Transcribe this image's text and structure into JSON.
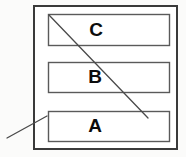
{
  "diagram": {
    "type": "schematic",
    "canvas": {
      "width": 186,
      "height": 157,
      "background": "#fbfbfa"
    },
    "outer_frame": {
      "name": "outer-container",
      "x": 33,
      "y": 5,
      "width": 145,
      "height": 145,
      "stroke": "#3a3a3a",
      "stroke_width": 2,
      "fill": "#ffffff"
    },
    "layers": [
      {
        "id": "layer-c",
        "label": "C",
        "x": 48,
        "y": 14,
        "width": 122,
        "height": 32,
        "stroke": "#5a5a5a",
        "stroke_width": 1.4,
        "fill": "#ffffff"
      },
      {
        "id": "layer-b",
        "label": "B",
        "x": 48,
        "y": 62,
        "width": 122,
        "height": 31,
        "stroke": "#5a5a5a",
        "stroke_width": 1.4,
        "fill": "#ffffff"
      },
      {
        "id": "layer-a",
        "label": "A",
        "x": 48,
        "y": 111,
        "width": 122,
        "height": 31,
        "stroke": "#5a5a5a",
        "stroke_width": 1.4,
        "fill": "#ffffff"
      }
    ],
    "leader_lines": [
      {
        "id": "leader-top",
        "description": "diagonal from top-left corner of layer C down to the right",
        "x1": 49,
        "y1": 15,
        "x2": 148,
        "y2": 118,
        "stroke": "#4a4a4a",
        "stroke_width": 1.3
      },
      {
        "id": "leader-bottom",
        "description": "diagonal from outside lower-left up to top-left corner of layer A",
        "x1": 7,
        "y1": 138,
        "x2": 47,
        "y2": 116,
        "stroke": "#4a4a4a",
        "stroke_width": 1.3
      }
    ],
    "labels": {
      "c": "C",
      "b": "B",
      "a": "A"
    },
    "colors": {
      "outline_dark": "#3a3a3a",
      "outline_light": "#5a5a5a",
      "leader": "#4a4a4a",
      "text": "#0c0c0c",
      "page_background": "#fbfbfa",
      "box_fill": "#ffffff"
    }
  }
}
